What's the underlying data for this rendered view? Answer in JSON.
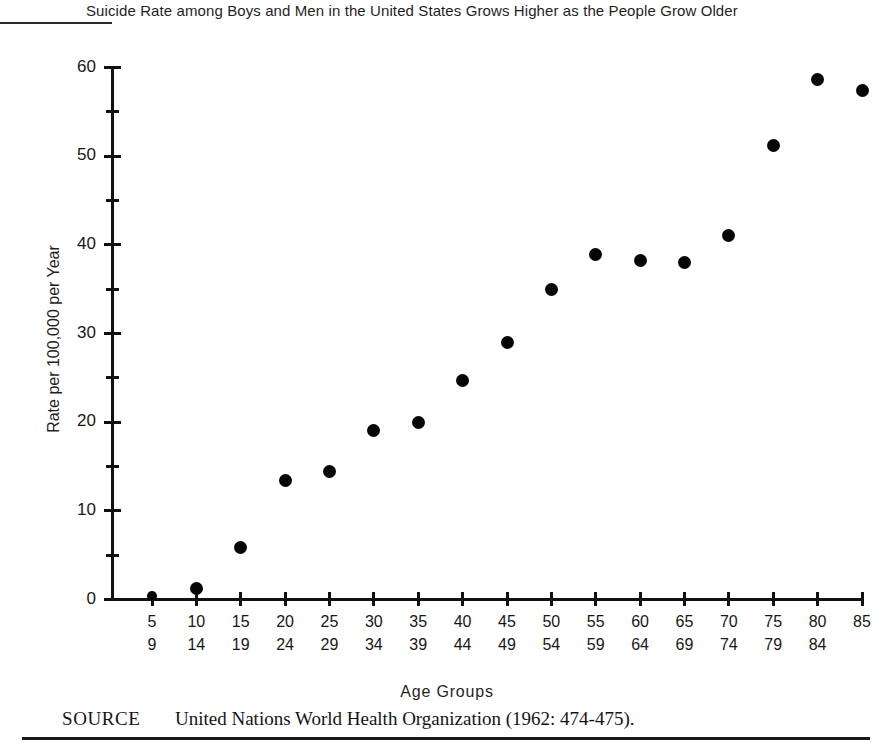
{
  "chart_data": {
    "type": "scatter",
    "title": "Suicide Rate among Boys and Men in the United States Grows Higher as the People Grow Older",
    "xlabel": "Age Groups",
    "ylabel": "Rate per 100,000 per Year",
    "ylim": [
      0,
      60
    ],
    "y_ticks_major": [
      0,
      10,
      20,
      30,
      40,
      50,
      60
    ],
    "y_ticks_minor": [
      5,
      15,
      25,
      35,
      45,
      55
    ],
    "grid": false,
    "legend": "none",
    "categories": [
      "5-9",
      "10-14",
      "15-19",
      "20-24",
      "25-29",
      "30-34",
      "35-39",
      "40-44",
      "45-49",
      "50-54",
      "55-59",
      "60-64",
      "65-69",
      "70-74",
      "75-79",
      "80-84",
      "85"
    ],
    "x_tick_labels": [
      {
        "lo": "5",
        "hi": "9"
      },
      {
        "lo": "10",
        "hi": "14"
      },
      {
        "lo": "15",
        "hi": "19"
      },
      {
        "lo": "20",
        "hi": "24"
      },
      {
        "lo": "25",
        "hi": "29"
      },
      {
        "lo": "30",
        "hi": "34"
      },
      {
        "lo": "35",
        "hi": "39"
      },
      {
        "lo": "40",
        "hi": "44"
      },
      {
        "lo": "45",
        "hi": "49"
      },
      {
        "lo": "50",
        "hi": "54"
      },
      {
        "lo": "55",
        "hi": "59"
      },
      {
        "lo": "60",
        "hi": "64"
      },
      {
        "lo": "65",
        "hi": "69"
      },
      {
        "lo": "70",
        "hi": "74"
      },
      {
        "lo": "75",
        "hi": "79"
      },
      {
        "lo": "80",
        "hi": "84"
      },
      {
        "lo": "85",
        "hi": ""
      }
    ],
    "values": [
      0.4,
      1.2,
      5.9,
      13.4,
      14.4,
      19.1,
      20.0,
      24.7,
      29.0,
      35.0,
      38.9,
      38.2,
      38.0,
      41.1,
      51.2,
      58.7,
      57.4
    ],
    "marker_color": "#050505",
    "axis_color": "#111111"
  },
  "source": {
    "label": "SOURCE",
    "text": "United Nations World Health Organization (1962: 474-475)."
  }
}
